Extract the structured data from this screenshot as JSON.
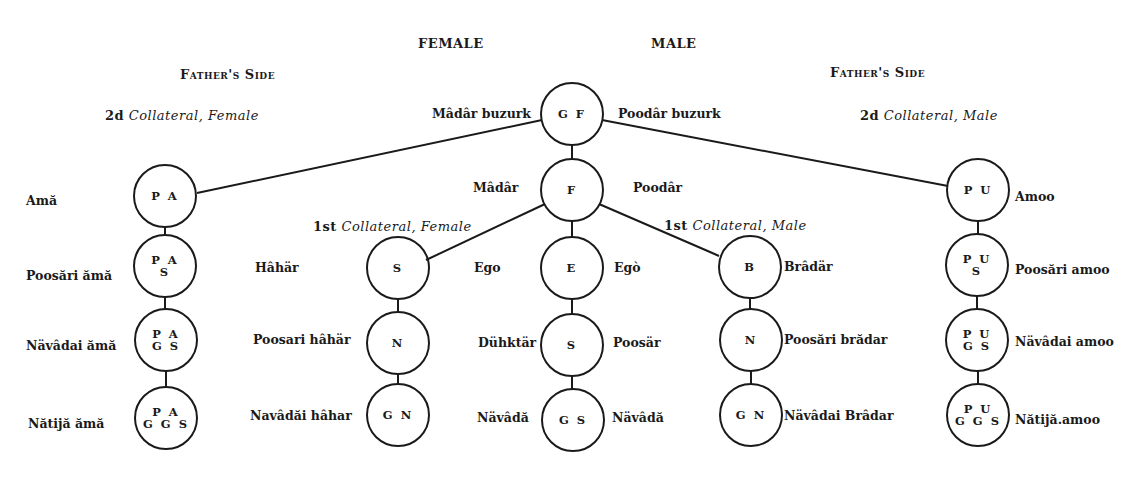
{
  "headings": {
    "female": "FEMALE",
    "male": "MALE",
    "fathers_side_left": "Father's Side",
    "fathers_side_right": "Father's Side",
    "second_collateral_female": {
      "prefix": "2d",
      "text": "Collateral, Female"
    },
    "second_collateral_male": {
      "prefix": "2d",
      "text": "Collateral, Male"
    },
    "first_collateral_female": {
      "prefix": "1st",
      "text": "Collateral, Female"
    },
    "first_collateral_male": {
      "prefix": "1st",
      "text": "Collateral, Male"
    }
  },
  "nodes": {
    "GF": {
      "line1": "G F",
      "line2": "",
      "left": "Mâdâr buzurk",
      "right": "Poodâr buzurk"
    },
    "F": {
      "line1": "F",
      "line2": "",
      "left": "Mâdâr",
      "right": "Poodâr"
    },
    "E": {
      "line1": "E",
      "line2": "",
      "left": "Ego",
      "right": "Egò"
    },
    "ES": {
      "line1": "S",
      "line2": "",
      "left": "Dühktär",
      "right": "Poosär"
    },
    "EGS": {
      "line1": "G S",
      "line2": "",
      "left": "Nävâdă",
      "right": "Nävâdă"
    },
    "PA": {
      "line1": "P A",
      "line2": "",
      "left": "Amă"
    },
    "PAS": {
      "line1": "P A",
      "line2": "S",
      "left": "Poosări ămă"
    },
    "PAGS": {
      "line1": "P A",
      "line2": "G S",
      "left": "Nävâdai ămă"
    },
    "PAGGS": {
      "line1": "P A",
      "line2": "G G S",
      "left": "Nătijă ămă"
    },
    "SS": {
      "line1": "S",
      "line2": "",
      "left": "Hâhär"
    },
    "SN": {
      "line1": "N",
      "line2": "",
      "left": "Poosari hâhär"
    },
    "SGN": {
      "line1": "G N",
      "line2": "",
      "left": "Navâdăi hâhar"
    },
    "BB": {
      "line1": "B",
      "line2": "",
      "right": "Brâdär"
    },
    "BN": {
      "line1": "N",
      "line2": "",
      "right": "Poosări brădar"
    },
    "BGN": {
      "line1": "G N",
      "line2": "",
      "right": "Nävâdai Brâdar"
    },
    "PU": {
      "line1": "P U",
      "line2": "",
      "right": "Amoo"
    },
    "PUS": {
      "line1": "P U",
      "line2": "S",
      "right": "Poosări amoo"
    },
    "PUGS": {
      "line1": "P U",
      "line2": "G S",
      "right": "Nävâdai amoo"
    },
    "PUGGS": {
      "line1": "P U",
      "line2": "G G S",
      "right": "Nătijă.amoo"
    }
  },
  "colors": {
    "ink": "#1a1a1a",
    "background": "#ffffff"
  }
}
